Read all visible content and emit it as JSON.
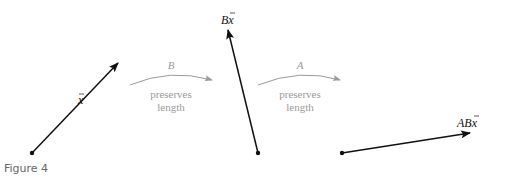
{
  "figure": {
    "caption": "Figure 4",
    "vectors": [
      {
        "label": "x⃗",
        "text": "x",
        "from": [
          32,
          153
        ],
        "to": [
          118,
          63
        ]
      },
      {
        "label": "Bx⃗",
        "text": "Bx",
        "from": [
          258,
          153
        ],
        "to": [
          228,
          30
        ]
      },
      {
        "label": "ABx⃗",
        "text": "ABx",
        "from": [
          342,
          153
        ],
        "to": [
          470,
          133
        ]
      }
    ],
    "transforms": [
      {
        "name": "B",
        "line1": "preserves",
        "line2": "length"
      },
      {
        "name": "A",
        "line1": "preserves",
        "line2": "length"
      }
    ],
    "colors": {
      "vector": "#111111",
      "transform": "#9a9a9a"
    }
  }
}
